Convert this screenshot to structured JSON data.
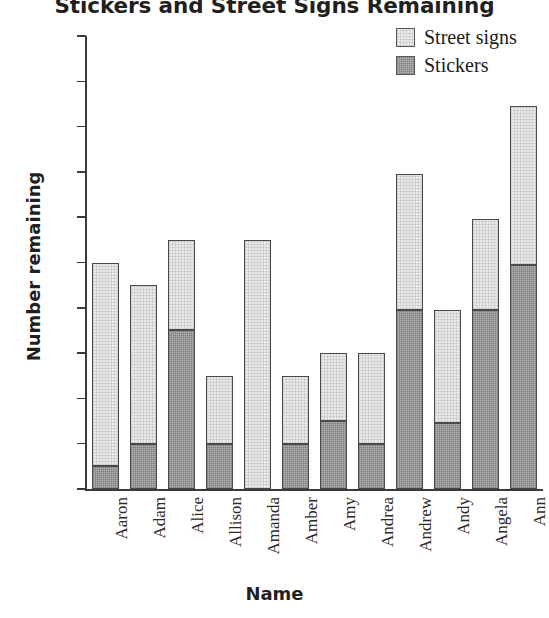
{
  "chart_data": {
    "type": "bar",
    "subtype": "stacked-vertical",
    "title": "Stickers and Street Signs Remaining",
    "xlabel": "Name",
    "ylabel": "Number remaining",
    "ylim": [
      0,
      20
    ],
    "ytick_labels": [
      "20",
      "18",
      "16",
      "14",
      "12",
      "10",
      "8",
      "6",
      "4",
      "2",
      "0"
    ],
    "ytick_values": [
      20,
      18,
      16,
      14,
      12,
      10,
      8,
      6,
      4,
      2,
      0
    ],
    "grid": false,
    "legend_position": "top-right",
    "categories": [
      "Aaron",
      "Adam",
      "Alice",
      "Allison",
      "Amanda",
      "Amber",
      "Amy",
      "Andrea",
      "Andrew",
      "Andy",
      "Angela",
      "Ann"
    ],
    "series": [
      {
        "name": "Stickers",
        "stack_order": "bottom",
        "color": "#b4b4b4",
        "values": [
          1,
          2,
          7,
          2,
          0,
          2,
          3,
          2,
          7.9,
          2.9,
          7.9,
          9.9
        ]
      },
      {
        "name": "Street signs",
        "stack_order": "top",
        "color": "#e9e9e9",
        "values": [
          9,
          7,
          4,
          3,
          11,
          3,
          3,
          4,
          6,
          5,
          4,
          7
        ]
      }
    ],
    "totals": [
      10,
      9,
      11,
      5,
      11,
      5,
      6,
      6,
      13.9,
      7.9,
      11.9,
      16.9
    ]
  },
  "legend": {
    "items": [
      {
        "label": "Street signs",
        "swatch": "light"
      },
      {
        "label": "Stickers",
        "swatch": "dark"
      }
    ]
  }
}
